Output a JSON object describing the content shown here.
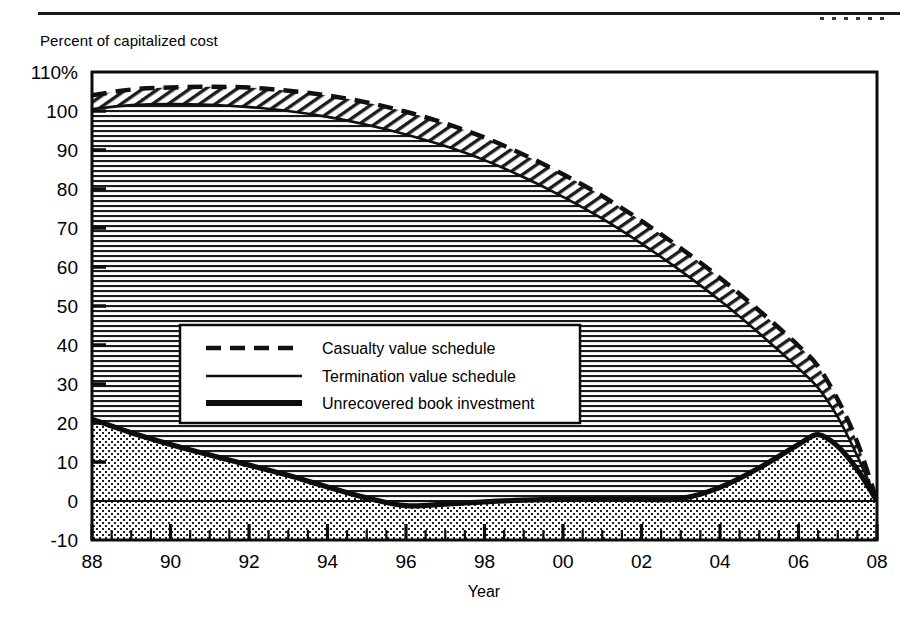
{
  "page": {
    "axis_note": "Percent of capitalized cost"
  },
  "chart_data": {
    "type": "area",
    "title": "",
    "subtitle": "",
    "xlabel": "Year",
    "ylabel": "Percent of capitalized cost",
    "xlim": [
      1988,
      2008
    ],
    "ylim": [
      -10,
      110
    ],
    "grid": false,
    "legend_position": "inside-left-middle",
    "y_ticks": [
      "110%",
      "100",
      "90",
      "80",
      "70",
      "60",
      "50",
      "40",
      "30",
      "20",
      "10",
      "0",
      "-10"
    ],
    "y_tick_values": [
      110,
      100,
      90,
      80,
      70,
      60,
      50,
      40,
      30,
      20,
      10,
      0,
      -10
    ],
    "x_ticks": [
      "88",
      "90",
      "92",
      "94",
      "96",
      "98",
      "00",
      "02",
      "04",
      "06",
      "08"
    ],
    "x_tick_values": [
      1988,
      1990,
      1992,
      1994,
      1996,
      1998,
      2000,
      2002,
      2004,
      2006,
      2008
    ],
    "x": [
      1988,
      1989,
      1990,
      1991,
      1992,
      1993,
      1994,
      1995,
      1996,
      1997,
      1998,
      1999,
      2000,
      2001,
      2002,
      2003,
      2004,
      2005,
      2006,
      2006.5,
      2007,
      2007.5,
      2008
    ],
    "series": [
      {
        "name": "Casualty value schedule",
        "style": "dashed",
        "values": [
          104,
          105.5,
          106,
          106.2,
          106,
          105.2,
          104,
          102.2,
          99.8,
          96.8,
          93.2,
          88.8,
          83.8,
          78.2,
          71.8,
          64.8,
          57.2,
          48.8,
          39.8,
          34.5,
          26,
          15,
          0
        ]
      },
      {
        "name": "Termination value schedule",
        "style": "thin-solid",
        "values": [
          100.5,
          101.5,
          101.8,
          101.6,
          101,
          100,
          98.5,
          96.5,
          94,
          91,
          87.4,
          83,
          78,
          72.4,
          66,
          59,
          51.4,
          43,
          34,
          29,
          21.5,
          11.5,
          0
        ]
      },
      {
        "name": "Unrecovered book investment",
        "style": "thick-solid",
        "values": [
          21,
          17.5,
          14.5,
          11.8,
          9.2,
          6.6,
          3.6,
          0.8,
          -1.2,
          -0.8,
          -0.2,
          0.2,
          0.4,
          0.4,
          0.4,
          0.6,
          3.5,
          8.5,
          14.5,
          17,
          14,
          8,
          0
        ]
      }
    ],
    "annotations": {
      "fill_between_casualty_termination": "diagonal-hatch",
      "fill_under_termination": "horizontal-hatch",
      "fill_under_unrecovered": "dotted"
    }
  },
  "legend": {
    "items": [
      {
        "label": "Casualty value schedule",
        "style": "dashed"
      },
      {
        "label": "Termination value schedule",
        "style": "thin-solid"
      },
      {
        "label": "Unrecovered book investment",
        "style": "thick-solid"
      }
    ]
  }
}
